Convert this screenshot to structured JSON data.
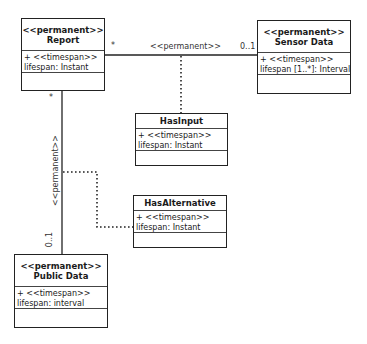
{
  "classes": {
    "report": {
      "stereotype": "<<permanent>>",
      "name": "Report",
      "attr1": "+ <<timespan>>",
      "attr2": "lifespan: Instant"
    },
    "sensor": {
      "stereotype": "<<permanent>>",
      "name": "Sensor Data",
      "attr1": "+ <<timespan>>",
      "attr2": "lifespan [1..*]: Interval"
    },
    "hasinput": {
      "name": "HasInput",
      "attr1": "+ <<timespan>>",
      "attr2": "lifespan: Instant"
    },
    "hasalt": {
      "name": "HasAlternative",
      "attr1": "+ <<timespan>>",
      "attr2": "lifespan: Instant"
    },
    "public": {
      "stereotype": "<<permanent>>",
      "name": "Public Data",
      "attr1": "+ <<timespan>>",
      "attr2": "lifespan: interval"
    }
  },
  "associations": {
    "report_sensor": {
      "label": "<<permanent>>",
      "source_mult": "*",
      "target_mult": "0..1"
    },
    "report_public": {
      "label": "<<permanent>>",
      "source_mult": "*",
      "target_mult": "0..1"
    }
  },
  "colors": {
    "line": "#222222",
    "box_border": "#222222",
    "background": "#ffffff"
  }
}
